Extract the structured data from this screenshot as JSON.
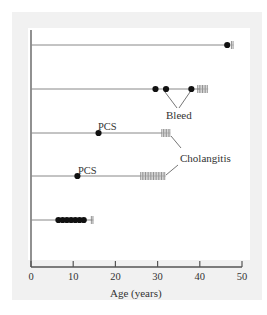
{
  "chart_data": {
    "type": "timeline",
    "title": "",
    "xlabel": "Age (years)",
    "ylabel": "",
    "xlim": [
      0,
      50
    ],
    "x_ticks": [
      0,
      10,
      20,
      30,
      40,
      50
    ],
    "x_tick_labels": [
      "0",
      "10",
      "20",
      "30",
      "40",
      "50"
    ],
    "grid": false,
    "patients": [
      {
        "row": 1,
        "line_end": 46.5,
        "events": [
          46.5
        ],
        "hatch": [
          47.5,
          48.0
        ]
      },
      {
        "row": 2,
        "line_end": 40,
        "events": [
          29.5,
          32,
          38
        ],
        "hatch": [
          39.5,
          42
        ]
      },
      {
        "row": 3,
        "line_end": 31,
        "events": [
          16
        ],
        "hatch": [
          31,
          33
        ]
      },
      {
        "row": 4,
        "line_end": 26,
        "events": [
          11
        ],
        "hatch": [
          26,
          32
        ]
      },
      {
        "row": 5,
        "line_end": 14.5,
        "events": [
          6.5,
          7.5,
          8.5,
          9.5,
          10.5,
          11.5,
          12.5
        ],
        "hatch": [
          14.3,
          14.8
        ]
      }
    ],
    "annotations": [
      {
        "text": "Bleed",
        "points_to": "row 2 events at 32 and 38"
      },
      {
        "text": "PCS",
        "points_to": "row 3 event at 16"
      },
      {
        "text": "PCS",
        "points_to": "row 4 event at 11"
      },
      {
        "text": "Cholangitis",
        "points_to": "row 3 hatch and row 4 hatch"
      }
    ]
  },
  "labels": {
    "xlabel": "Age (years)",
    "bleed": "Bleed",
    "pcs_row3": "PCS",
    "pcs_row4": "PCS",
    "cholangitis": "Cholangitis",
    "ticks": [
      "0",
      "10",
      "20",
      "30",
      "40",
      "50"
    ]
  }
}
